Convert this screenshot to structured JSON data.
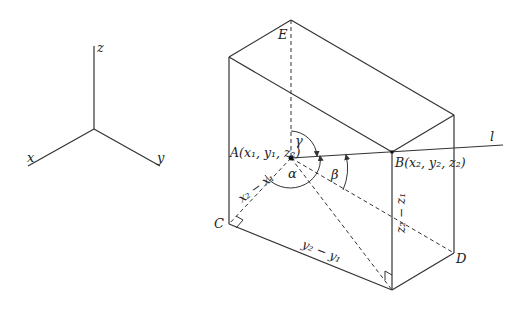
{
  "axes": {
    "x_label": "x",
    "y_label": "y",
    "z_label": "z"
  },
  "points": {
    "A": "A(x₁, y₁, z₂)",
    "B": "B(x₂, y₂, z₂)",
    "C": "C",
    "D": "D",
    "E": "E"
  },
  "line_label": "l",
  "angles": {
    "alpha": "α",
    "beta": "β",
    "gamma": "γ"
  },
  "dimensions": {
    "dx": "x₂ − x₁",
    "dy": "y₂ − y₁",
    "dz": "z₂ − z₁"
  }
}
